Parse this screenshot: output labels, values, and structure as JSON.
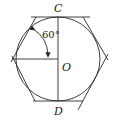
{
  "diagram": {
    "type": "geometry",
    "labels": {
      "top": "C",
      "bottom": "D",
      "center": "O",
      "angle": "60°"
    },
    "colors": {
      "stroke": "#2a2a2a",
      "background": "#ffffff"
    }
  }
}
